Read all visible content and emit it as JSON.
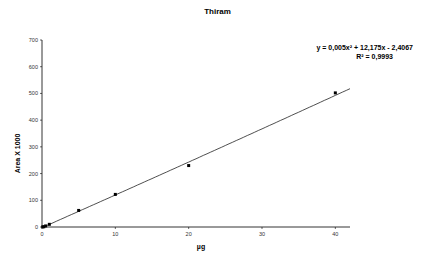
{
  "chart_data": {
    "type": "scatter",
    "title": "Thiram",
    "xlabel": "µg",
    "ylabel": "Area X 1000",
    "xlim": [
      0,
      42
    ],
    "ylim": [
      0,
      700
    ],
    "x_ticks": [
      "0",
      "10",
      "20",
      "30",
      "40"
    ],
    "y_ticks": [
      "0",
      "100",
      "200",
      "300",
      "400",
      "500",
      "600",
      "700"
    ],
    "grid": false,
    "legend": "none",
    "series": [
      {
        "name": "Thiram",
        "x": [
          0.1,
          0.25,
          0.5,
          1,
          5,
          10,
          20,
          40
        ],
        "y": [
          0.5,
          1,
          4,
          10,
          62,
          122,
          230,
          502
        ]
      }
    ],
    "trendline": {
      "type": "polynomial",
      "equation": "y = 0,005x² + 12,175x - 2,4067",
      "r_squared": "R² = 0,9993",
      "coefficients": [
        0.005,
        12.175,
        -2.4067
      ]
    }
  }
}
